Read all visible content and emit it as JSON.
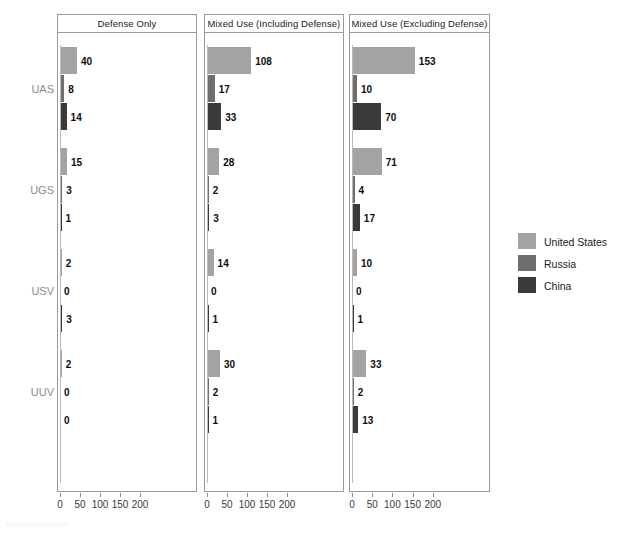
{
  "chart_data": {
    "type": "bar",
    "orientation": "horizontal",
    "title": "",
    "xlabel": "",
    "ylabel": "",
    "xlim": [
      0,
      240
    ],
    "xticks": [
      0,
      50,
      100,
      150,
      200
    ],
    "grid": false,
    "legend_position": "right",
    "categories": [
      "UAS",
      "UGS",
      "USV",
      "UUV"
    ],
    "series": [
      {
        "name": "United States",
        "color": "#a3a3a3"
      },
      {
        "name": "Russia",
        "color": "#6e6e6e"
      },
      {
        "name": "China",
        "color": "#3a3a3a"
      }
    ],
    "panels": [
      {
        "title": "Defense Only",
        "values": {
          "United States": [
            40,
            15,
            2,
            2
          ],
          "Russia": [
            8,
            3,
            0,
            0
          ],
          "China": [
            14,
            1,
            3,
            0
          ]
        }
      },
      {
        "title": "Mixed Use (Including Defense)",
        "values": {
          "United States": [
            108,
            28,
            14,
            30
          ],
          "Russia": [
            17,
            2,
            0,
            2
          ],
          "China": [
            33,
            3,
            1,
            1
          ]
        }
      },
      {
        "title": "Mixed Use (Excluding Defense)",
        "values": {
          "United States": [
            153,
            71,
            10,
            33
          ],
          "Russia": [
            10,
            4,
            0,
            2
          ],
          "China": [
            70,
            17,
            1,
            13
          ]
        }
      }
    ]
  },
  "legend": {
    "items": [
      {
        "label": "United States",
        "color": "#a3a3a3"
      },
      {
        "label": "Russia",
        "color": "#6e6e6e"
      },
      {
        "label": "China",
        "color": "#3a3a3a"
      }
    ]
  }
}
